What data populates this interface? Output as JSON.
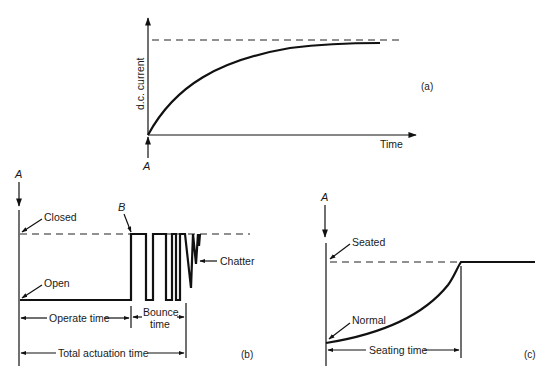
{
  "panel_a": {
    "caption": "(a)",
    "y_axis_label": "d.c. current",
    "x_axis_label": "Time",
    "marker": "A"
  },
  "panel_b": {
    "caption": "(b)",
    "marker_top": "A",
    "marker_b": "B",
    "label_closed": "Closed",
    "label_open": "Open",
    "label_chatter": "Chatter",
    "label_operate_time": "Operate time",
    "label_bounce_line1": "Bounce",
    "label_bounce_line2": "time",
    "label_total": "Total actuation time"
  },
  "panel_c": {
    "caption": "(c)",
    "marker_top": "A",
    "label_seated": "Seated",
    "label_normal": "Normal",
    "label_seating_time": "Seating time"
  },
  "colors": {
    "ink": "#111111",
    "background": "#ffffff"
  }
}
